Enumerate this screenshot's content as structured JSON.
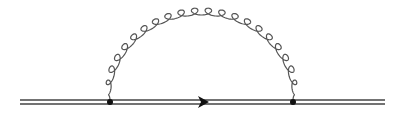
{
  "diagram": {
    "type": "feynman",
    "colors": {
      "line": "#444444",
      "vertex": "#111111",
      "gluon": "#555555"
    },
    "propagators": [
      {
        "kind": "heavy-quark",
        "style": "double-line",
        "from": "in",
        "to": "v1"
      },
      {
        "kind": "heavy-quark",
        "style": "double-line",
        "from": "v1",
        "to": "v2",
        "arrow": "forward"
      },
      {
        "kind": "heavy-quark",
        "style": "double-line",
        "from": "v2",
        "to": "out"
      },
      {
        "kind": "gluon",
        "style": "curly",
        "from": "v1",
        "to": "v2",
        "shape": "semicircle-arc",
        "loops": 22
      }
    ],
    "vertices": [
      "v1",
      "v2"
    ]
  }
}
